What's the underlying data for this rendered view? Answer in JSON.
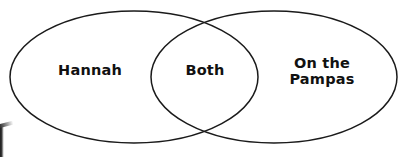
{
  "figure": {
    "type": "venn-diagram",
    "title": "",
    "background_color": "#ffffff",
    "stroke_color": "#1a1a1a",
    "text_color": "#111111"
  },
  "venn": {
    "sets": [
      {
        "id": "left",
        "label": "Hannah",
        "region": "left-only",
        "cx": 134,
        "cy": 77,
        "rx": 124,
        "ry": 66
      },
      {
        "id": "right",
        "label": "On the\nPampas",
        "region": "right-only",
        "cx": 274,
        "cy": 77,
        "rx": 123,
        "ry": 66
      }
    ],
    "intersection": {
      "id": "both",
      "label": "Both",
      "region": "overlap"
    }
  },
  "artifacts": {
    "page_edge": "scan-edge-shadow"
  }
}
